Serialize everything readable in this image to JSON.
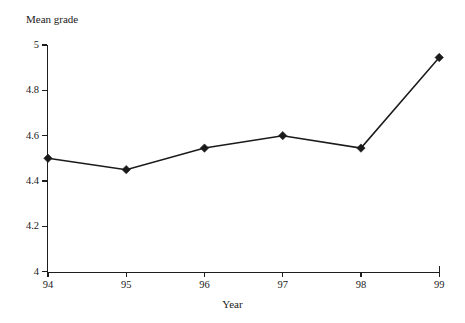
{
  "chart_data": {
    "type": "line",
    "title": "",
    "xlabel": "Year",
    "ylabel": "Mean grade",
    "categories": [
      "94",
      "95",
      "96",
      "97",
      "98",
      "99"
    ],
    "values": [
      4.5,
      4.45,
      4.545,
      4.6,
      4.545,
      4.945
    ],
    "series": [
      {
        "name": "Mean grade",
        "values": [
          4.5,
          4.45,
          4.545,
          4.6,
          4.545,
          4.945
        ],
        "color": "#1a1a1a",
        "marker": "diamond",
        "marker_filled": true
      }
    ],
    "ylim": [
      4,
      5
    ],
    "ytick_labels": [
      "4",
      "4.2",
      "4.4",
      "4.6",
      "4.8",
      "5"
    ],
    "ytick_values": [
      4,
      4.2,
      4.4,
      4.6,
      4.8,
      5
    ],
    "xtick_labels": [
      "94",
      "95",
      "96",
      "97",
      "98",
      "99"
    ],
    "grid": false,
    "legend": false,
    "legend_position": "none",
    "line_color": "#1a1a1a",
    "background_color": "#ffffff"
  }
}
